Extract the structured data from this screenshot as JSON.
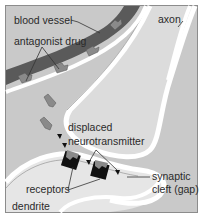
{
  "diagram": {
    "type": "synapse-illustration",
    "labels": {
      "blood_vessel": "blood vessel",
      "antagonist_drug": "antagonist drug",
      "axon": "axon",
      "displaced_line1": "displaced",
      "displaced_line2": "neurotransmitter",
      "synaptic_line1": "synaptic",
      "synaptic_line2": "cleft (gap)",
      "receptors": "receptors",
      "dendrite": "dendrite"
    },
    "colors": {
      "background": "#c8c8c8",
      "vessel": "#5a5a5a",
      "membrane": "#ffffff",
      "axon_fill": "#dcdcdc",
      "dendrite_fill": "#e6e6e6",
      "drug": "#8a8a8a",
      "receptor": "#111111",
      "frame": "#8c8c8c"
    }
  }
}
